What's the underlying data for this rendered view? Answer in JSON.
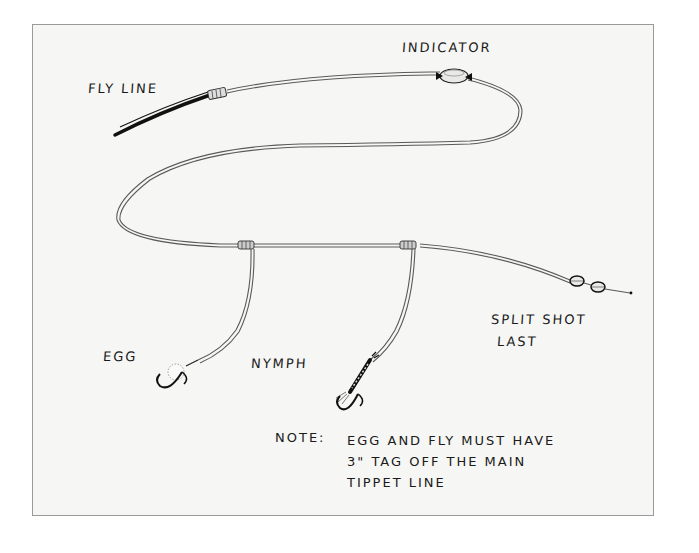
{
  "diagram": {
    "type": "fly fishing nymph rig sketch",
    "labels": {
      "fly_line": "FLY LINE",
      "indicator": "INDICATOR",
      "egg": "EGG",
      "nymph": "NYMPH",
      "split_shot": "SPLIT SHOT",
      "last": "LAST"
    },
    "note": {
      "heading": "NOTE:",
      "lines": [
        "EGG AND FLY MUST HAVE",
        "3\" TAG OFF THE MAIN",
        "TIPPET LINE"
      ]
    },
    "components": [
      "fly line",
      "nail knot",
      "leader",
      "indicator",
      "tippet",
      "blood knot with egg tag",
      "blood knot with nymph tag",
      "egg fly",
      "nymph fly",
      "split shot x2"
    ],
    "colors": {
      "ink": "#1a1a1a",
      "line": "#5a5a5a",
      "paper": "#f6f6f4",
      "frame": "#9a9a9a"
    }
  }
}
